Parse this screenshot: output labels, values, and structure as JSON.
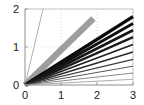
{
  "chart_data": {
    "type": "line",
    "title": "",
    "xlabel": "",
    "ylabel": "",
    "xlim": [
      0,
      3
    ],
    "ylim": [
      0,
      2
    ],
    "xticks": [
      0,
      1,
      2,
      3
    ],
    "yticks": [
      0,
      1,
      2
    ],
    "xtick_labels": [
      "0",
      "1",
      "2",
      "3"
    ],
    "ytick_labels": [
      "0",
      "1",
      "2"
    ],
    "grid": true,
    "grid_style": "dotted",
    "grid_color": "#c8c8c8",
    "legend": "none",
    "background": "#ffffff",
    "frame": true,
    "frame_color": "#b4b4b4",
    "series": [
      {
        "name": "steep-thin-gray",
        "slope": 4.0,
        "x": [
          0,
          0.5
        ],
        "y": [
          0,
          2.0
        ],
        "color": "#9a9a9a",
        "width": 0.8
      },
      {
        "name": "thick-gray",
        "slope": 0.92,
        "x": [
          0,
          1.9
        ],
        "y": [
          0,
          1.75
        ],
        "color": "#9e9e9e",
        "width": 6.5
      },
      {
        "name": "black-1",
        "slope": 0.6,
        "x": [
          0,
          3
        ],
        "y": [
          0,
          1.8
        ],
        "color": "#0a0a0a",
        "width": 3.4
      },
      {
        "name": "black-2",
        "slope": 0.54,
        "x": [
          0,
          3
        ],
        "y": [
          0,
          1.62
        ],
        "color": "#111111",
        "width": 3.0
      },
      {
        "name": "black-3",
        "slope": 0.48,
        "x": [
          0,
          3
        ],
        "y": [
          0,
          1.44
        ],
        "color": "#151515",
        "width": 2.6
      },
      {
        "name": "black-4",
        "slope": 0.42,
        "x": [
          0,
          3
        ],
        "y": [
          0,
          1.26
        ],
        "color": "#1a1a1a",
        "width": 2.2
      },
      {
        "name": "black-5",
        "slope": 0.355,
        "x": [
          0,
          3
        ],
        "y": [
          0,
          1.065
        ],
        "color": "#222222",
        "width": 1.8
      },
      {
        "name": "black-6",
        "slope": 0.29,
        "x": [
          0,
          3
        ],
        "y": [
          0,
          0.87
        ],
        "color": "#2b2b2b",
        "width": 1.45
      },
      {
        "name": "black-7",
        "slope": 0.225,
        "x": [
          0,
          3
        ],
        "y": [
          0,
          0.675
        ],
        "color": "#3a3a3a",
        "width": 1.15
      },
      {
        "name": "black-8",
        "slope": 0.165,
        "x": [
          0,
          3
        ],
        "y": [
          0,
          0.495
        ],
        "color": "#4f4f4f",
        "width": 0.95
      },
      {
        "name": "black-9",
        "slope": 0.105,
        "x": [
          0,
          3
        ],
        "y": [
          0,
          0.315
        ],
        "color": "#6b6b6b",
        "width": 0.8
      },
      {
        "name": "black-10",
        "slope": 0.05,
        "x": [
          0,
          3
        ],
        "y": [
          0,
          0.15
        ],
        "color": "#8a8a8a",
        "width": 0.7
      }
    ]
  },
  "figure": {
    "width": 144,
    "height": 105
  }
}
